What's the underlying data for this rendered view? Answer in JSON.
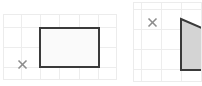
{
  "canvas": {
    "width": 202,
    "height": 86,
    "background": "#ffffff",
    "title": "Two geometry grid figures"
  },
  "style": {
    "grid_line_color": "#ededed",
    "grid_border_color": "#ececec",
    "grid_cell_px": 20,
    "shape_outline_color": "#3a3a3a",
    "shape_fill_left": "#fafafa",
    "shape_fill_right": "#d4d4d4",
    "x_mark_color": "#8c8c8c"
  },
  "panels": [
    {
      "id": "left-panel",
      "label": "Left grid figure",
      "origin": {
        "x": 3,
        "y": 14
      },
      "size": {
        "width": 114,
        "height": 66
      },
      "grid": {
        "cols": 6,
        "rows": 4,
        "cell": 19
      },
      "x_mark": {
        "label": "x-mark-left",
        "cx": 19,
        "cy": 50
      },
      "shape": {
        "label": "rectangle",
        "type": "rectangle",
        "points": "37,14 96,14 96,53 37,53",
        "fill": "#fafafa",
        "stroke": "#3a3a3a",
        "stroke_width": 2,
        "width_cells": 3,
        "height_cells": 2
      }
    },
    {
      "id": "right-panel",
      "label": "Right grid figure (clipped)",
      "origin": {
        "x": 133,
        "y": 2
      },
      "size": {
        "width": 69,
        "height": 80
      },
      "grid": {
        "cols": 4,
        "rows": 4,
        "cell": 20
      },
      "x_mark": {
        "label": "x-mark-right",
        "cx": 19,
        "cy": 20
      },
      "shape": {
        "label": "shaded-quadrilateral",
        "type": "quadrilateral",
        "points": "48,17 69,26 69,68 48,68",
        "fill": "#d4d4d4",
        "stroke": "#3a3a3a",
        "stroke_width": 2,
        "note": "clipped by right edge"
      }
    }
  ],
  "icons": {
    "x_mark_glyph": "x-mark-icon"
  }
}
